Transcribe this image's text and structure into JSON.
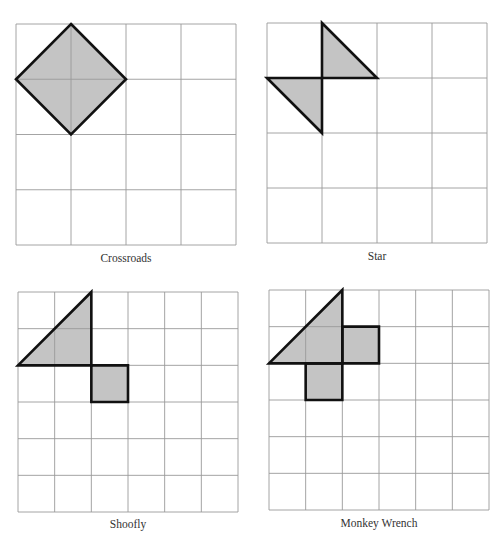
{
  "figures": [
    {
      "id": "crossroads",
      "caption": "Crossroads",
      "grid": {
        "cols": 4,
        "rows": 4
      },
      "shapes": [
        {
          "type": "polygon",
          "name": "diamond",
          "points": [
            [
              1,
              0
            ],
            [
              2,
              1
            ],
            [
              1,
              2
            ],
            [
              0,
              1
            ]
          ]
        }
      ]
    },
    {
      "id": "star",
      "caption": "Star",
      "grid": {
        "cols": 4,
        "rows": 4
      },
      "shapes": [
        {
          "type": "polygon",
          "name": "upper-triangle",
          "points": [
            [
              1,
              0
            ],
            [
              2,
              1
            ],
            [
              1,
              1
            ]
          ]
        },
        {
          "type": "polygon",
          "name": "lower-triangle",
          "points": [
            [
              0,
              1
            ],
            [
              1,
              1
            ],
            [
              1,
              2
            ]
          ]
        }
      ]
    },
    {
      "id": "shoofly",
      "caption": "Shoofly",
      "grid": {
        "cols": 6,
        "rows": 6
      },
      "shapes": [
        {
          "type": "polygon",
          "name": "triangle",
          "points": [
            [
              0,
              2
            ],
            [
              2,
              0
            ],
            [
              2,
              2
            ]
          ]
        },
        {
          "type": "polygon",
          "name": "square",
          "points": [
            [
              2,
              2
            ],
            [
              3,
              2
            ],
            [
              3,
              3
            ],
            [
              2,
              3
            ]
          ]
        }
      ]
    },
    {
      "id": "monkey-wrench",
      "caption": "Monkey Wrench",
      "grid": {
        "cols": 6,
        "rows": 6
      },
      "shapes": [
        {
          "type": "polygon",
          "name": "triangle",
          "points": [
            [
              0,
              2
            ],
            [
              2,
              0
            ],
            [
              2,
              2
            ]
          ]
        },
        {
          "type": "polygon",
          "name": "right-square",
          "points": [
            [
              2,
              1
            ],
            [
              3,
              1
            ],
            [
              3,
              2
            ],
            [
              2,
              2
            ]
          ]
        },
        {
          "type": "polygon",
          "name": "bottom-square",
          "points": [
            [
              1,
              2
            ],
            [
              2,
              2
            ],
            [
              2,
              3
            ],
            [
              1,
              3
            ]
          ]
        }
      ]
    }
  ]
}
